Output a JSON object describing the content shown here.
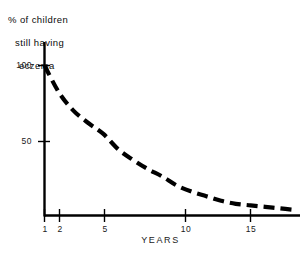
{
  "chart_data": {
    "type": "line",
    "title": "% of children still having eczema",
    "title_lines": [
      "% of children",
      "still having",
      "eczema"
    ],
    "xlabel": "YEARS",
    "ylabel": "% of children still having eczema",
    "xlim": [
      0,
      18
    ],
    "ylim": [
      0,
      112
    ],
    "grid": false,
    "legend": null,
    "line_style": "dashed",
    "line_color": "#000000",
    "x_ticks": [
      1,
      2,
      5,
      10,
      15
    ],
    "x_tick_labels": [
      "1",
      "2",
      "5",
      "10",
      "15"
    ],
    "y_ticks": [
      50,
      100
    ],
    "y_tick_labels": [
      "50",
      "100"
    ],
    "series": [
      {
        "name": "% of children still having eczema",
        "x": [
          1,
          2,
          3,
          4,
          5,
          6,
          7,
          8,
          9,
          10,
          11,
          12,
          13,
          14,
          15,
          16,
          17,
          18
        ],
        "values": [
          100,
          82,
          70,
          62,
          55,
          45,
          38,
          32,
          27,
          21,
          17,
          14,
          11,
          9,
          8,
          7,
          6,
          5
        ]
      }
    ]
  },
  "axis": {
    "x_title": "YEARS"
  }
}
